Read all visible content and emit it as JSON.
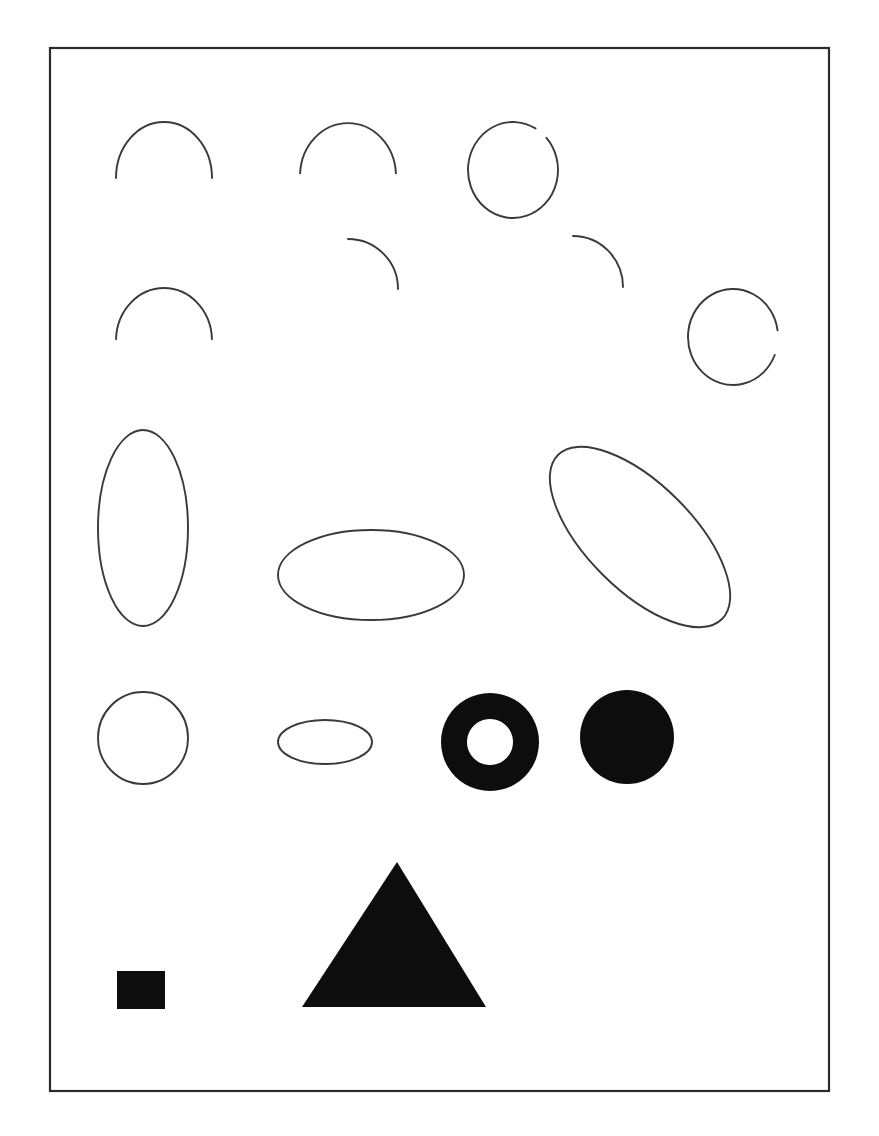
{
  "page": {
    "width": 879,
    "height": 1136,
    "background_color": "#ffffff",
    "outline_color": "#3a3a3a",
    "fill_color": "#0d0d0d",
    "frame_color": "#2b2b2b"
  },
  "frame": {
    "name": "page-border",
    "x": 50,
    "y": 48,
    "width": 779,
    "height": 1043,
    "stroke_width": 2.2
  },
  "rows": [
    {
      "label": "row-1-arcs",
      "shapes": [
        {
          "name": "semicircle-arc-1",
          "type": "arc",
          "cx": 164,
          "cy": 178,
          "rx": 48,
          "ry": 56,
          "start_angle": 180,
          "end_angle": 360,
          "description": "upper semicircular arc"
        },
        {
          "name": "semicircle-arc-2",
          "type": "arc",
          "cx": 348,
          "cy": 176,
          "rx": 48,
          "ry": 53,
          "start_angle": 183,
          "end_angle": 357,
          "description": "upper semicircular arc"
        },
        {
          "name": "c-shape-arc-1",
          "type": "arc",
          "cx": 513,
          "cy": 170,
          "rx": 45,
          "ry": 48,
          "start_angle": 318,
          "end_angle": 660,
          "description": "nearly closed circle with gap on right"
        }
      ]
    },
    {
      "label": "row-2-arcs",
      "shapes": [
        {
          "name": "semicircle-arc-3",
          "type": "arc",
          "cx": 164,
          "cy": 341,
          "rx": 48,
          "ry": 53,
          "start_angle": 182,
          "end_angle": 358,
          "description": "upper semicircular arc"
        },
        {
          "name": "quarter-arc-1",
          "type": "arc",
          "cx": 348,
          "cy": 289,
          "rx": 50,
          "ry": 50,
          "start_angle": 270,
          "end_angle": 360,
          "description": "upper-right quarter arc"
        },
        {
          "name": "quarter-arc-2",
          "type": "arc",
          "cx": 573,
          "cy": 287,
          "rx": 50,
          "ry": 51,
          "start_angle": 270,
          "end_angle": 360,
          "description": "upper-right quarter arc"
        },
        {
          "name": "c-shape-arc-2",
          "type": "arc",
          "cx": 733,
          "cy": 337,
          "rx": 45,
          "ry": 48,
          "start_angle": 22,
          "end_angle": 352,
          "description": "nearly closed circle with gap on lower right"
        }
      ]
    },
    {
      "label": "row-3-ellipses",
      "shapes": [
        {
          "name": "tall-vertical-ellipse",
          "type": "ellipse",
          "cx": 143,
          "cy": 528,
          "rx": 45,
          "ry": 98,
          "rotation": 0,
          "description": "tall narrow vertical ellipse outline"
        },
        {
          "name": "wide-horizontal-ellipse",
          "type": "ellipse",
          "cx": 371,
          "cy": 575,
          "rx": 93,
          "ry": 45,
          "rotation": 0,
          "description": "wide horizontal ellipse outline"
        },
        {
          "name": "tilted-ellipse",
          "type": "ellipse",
          "cx": 640,
          "cy": 537,
          "rx": 116,
          "ry": 53,
          "rotation": 45,
          "description": "ellipse rotated 45 degrees clockwise"
        }
      ]
    },
    {
      "label": "row-4-circles",
      "shapes": [
        {
          "name": "circle-outline",
          "type": "ellipse",
          "cx": 143,
          "cy": 738,
          "rx": 45,
          "ry": 46,
          "rotation": 0,
          "description": "plain circle outline"
        },
        {
          "name": "small-flat-ellipse",
          "type": "ellipse",
          "cx": 325,
          "cy": 742,
          "rx": 47,
          "ry": 22,
          "rotation": 0,
          "description": "small flattened horizontal ellipse outline"
        },
        {
          "name": "filled-ring",
          "type": "annulus",
          "cx": 490,
          "cy": 742,
          "outer_r": 49,
          "inner_r": 23,
          "description": "solid black ring with white center"
        },
        {
          "name": "filled-disk",
          "type": "disk",
          "cx": 627,
          "cy": 737,
          "r": 47,
          "description": "solid black filled circle"
        }
      ]
    },
    {
      "label": "row-5-polygons",
      "shapes": [
        {
          "name": "filled-square",
          "type": "rect",
          "x": 117,
          "y": 971,
          "width": 48,
          "height": 38,
          "description": "small solid black rectangle"
        },
        {
          "name": "filled-triangle",
          "type": "polygon",
          "points": "397,862 486,1007 302,1007",
          "description": "large solid black equilateral triangle"
        }
      ]
    }
  ]
}
